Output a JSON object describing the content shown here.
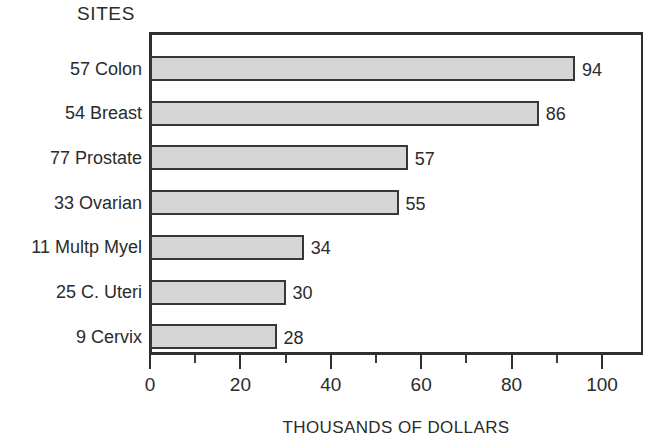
{
  "chart_data": {
    "type": "bar",
    "orientation": "horizontal",
    "title": "SITES",
    "xlabel": "THOUSANDS OF DOLLARS",
    "ylabel": "",
    "categories": [
      "57 Colon",
      "54 Breast",
      "77 Prostate",
      "33 Ovarian",
      "11 Multp Myel",
      "25 C. Uteri",
      "9 Cervix"
    ],
    "values": [
      94,
      86,
      57,
      55,
      34,
      30,
      28
    ],
    "value_labels": [
      "94",
      "86",
      "57",
      "55",
      "34",
      "30",
      "28"
    ],
    "xlim": [
      0,
      109.3
    ],
    "xticks": [
      0,
      20,
      40,
      60,
      80,
      100
    ],
    "xtick_labels": [
      "0",
      "20",
      "40",
      "60",
      "80",
      "100"
    ],
    "minor_xticks": [
      10,
      30,
      50,
      70,
      90
    ],
    "grid": false,
    "legend": false,
    "colors": {
      "bar_fill": "#d6d6d6",
      "bar_border": "#373737",
      "axis": "#2f2f2f",
      "text": "#2b2b2b",
      "background": "#ffffff"
    }
  }
}
